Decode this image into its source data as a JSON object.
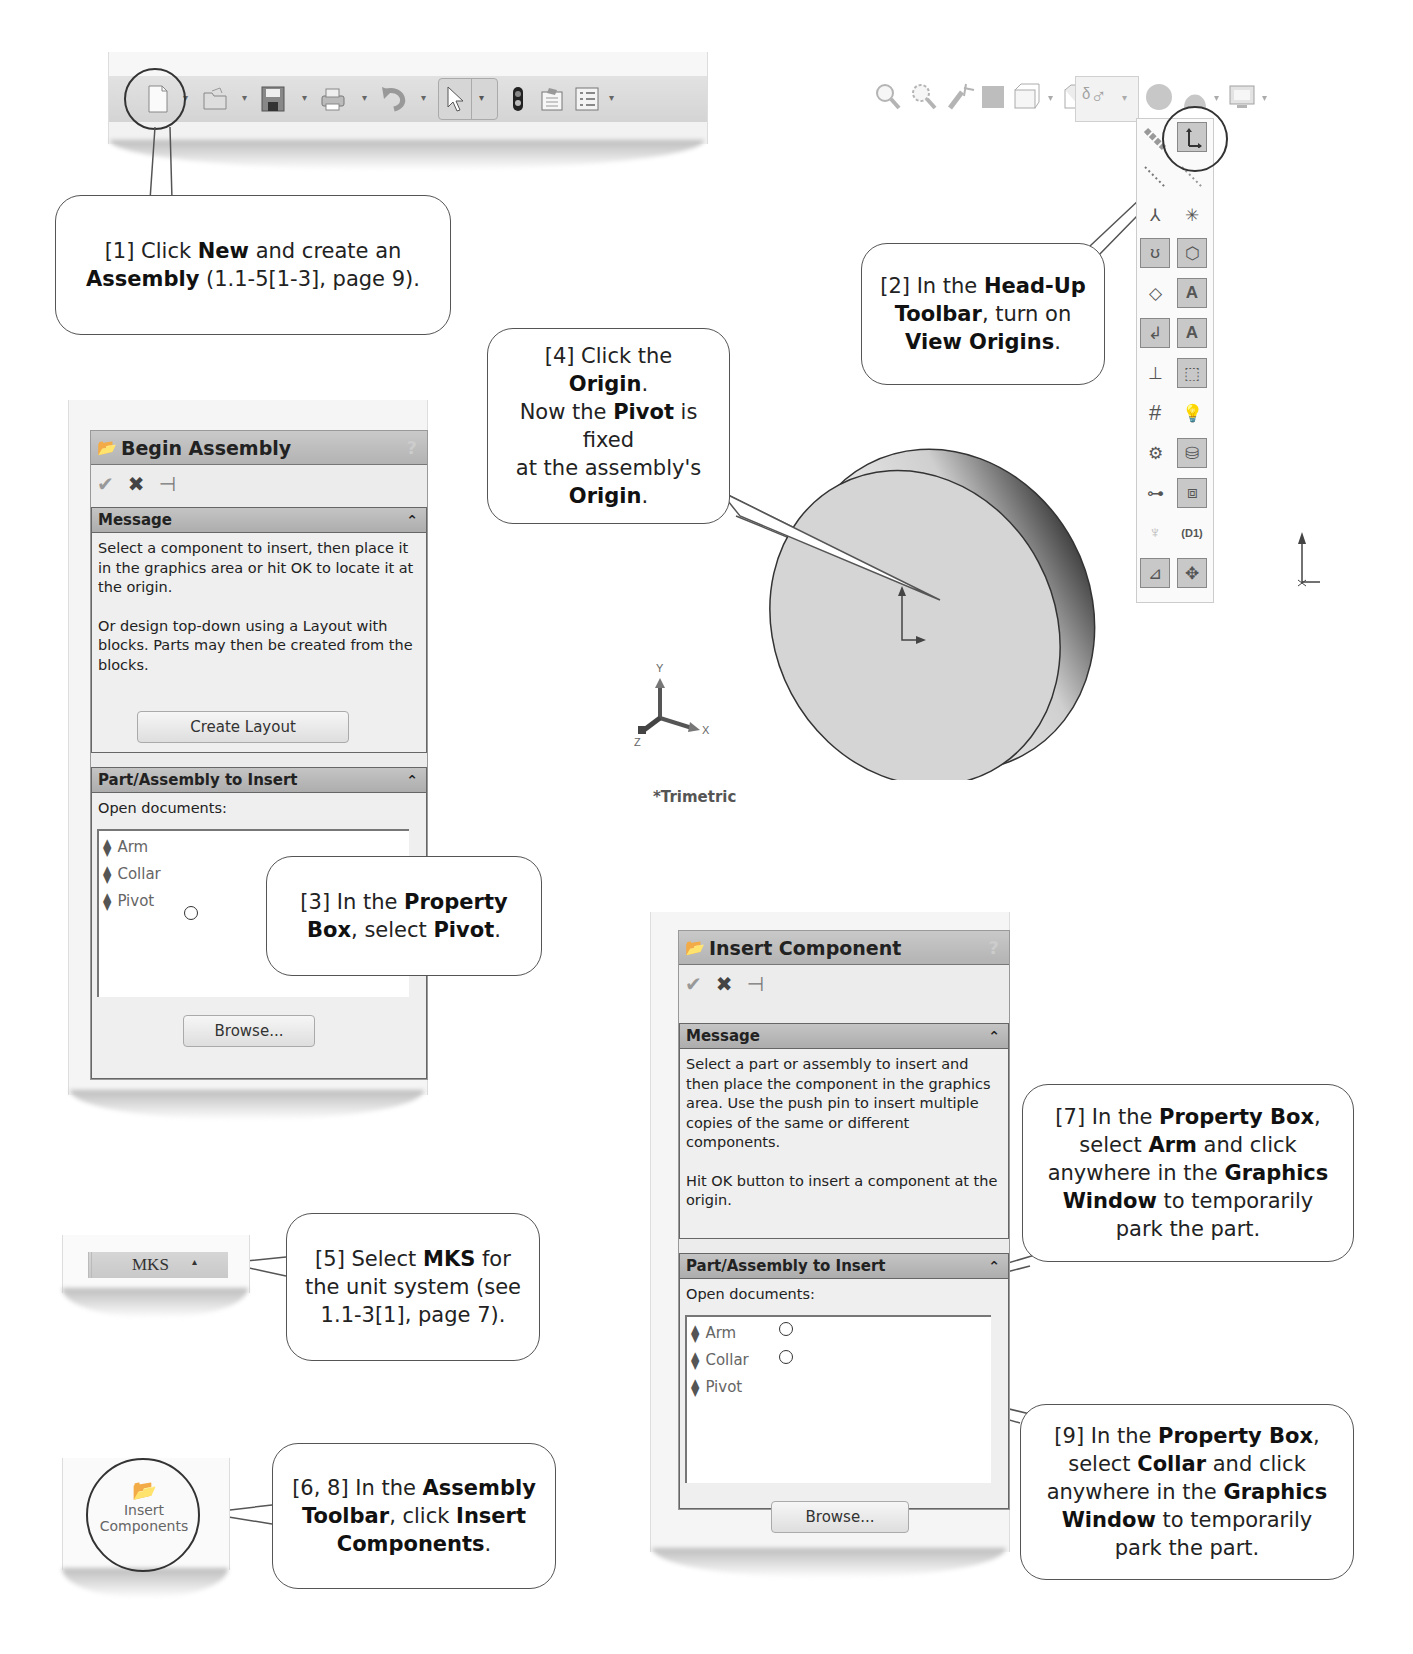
{
  "standard_toolbar": {
    "buttons": [
      {
        "name": "new",
        "icon": "new-document-icon",
        "glyph": "🗋"
      },
      {
        "name": "open",
        "icon": "open-folder-icon",
        "glyph": "📂"
      },
      {
        "name": "save",
        "icon": "save-disk-icon",
        "glyph": "💾"
      },
      {
        "name": "print",
        "icon": "printer-icon",
        "glyph": "🖶"
      },
      {
        "name": "undo",
        "icon": "undo-icon",
        "glyph": "↶"
      },
      {
        "name": "select",
        "icon": "select-arrow-icon",
        "glyph": "↖"
      },
      {
        "name": "rebuild",
        "icon": "rebuild-traffic-light-icon",
        "glyph": "▮"
      },
      {
        "name": "file-properties",
        "icon": "file-properties-icon",
        "glyph": "📋"
      },
      {
        "name": "options",
        "icon": "options-list-icon",
        "glyph": "☰"
      }
    ],
    "dropdown_glyph": "▾"
  },
  "headsup_toolbar": {
    "buttons": [
      {
        "name": "zoom-to-fit",
        "glyph": "🔍"
      },
      {
        "name": "zoom-to-area",
        "glyph": "🔎"
      },
      {
        "name": "previous-view",
        "glyph": "↶"
      },
      {
        "name": "section-view",
        "glyph": "▦"
      },
      {
        "name": "view-orientation",
        "glyph": "⧉"
      },
      {
        "name": "display-style",
        "glyph": "◻"
      },
      {
        "name": "hide-show-items",
        "glyph": "ᵟ♂"
      },
      {
        "name": "edit-appearance",
        "glyph": "●"
      },
      {
        "name": "apply-scene",
        "glyph": "▲"
      },
      {
        "name": "view-settings",
        "glyph": "🖥"
      }
    ],
    "flyout_items": [
      {
        "name": "view-axes",
        "glyph": "⟋",
        "on": false
      },
      {
        "name": "view-origins",
        "glyph": "⊾",
        "on": true
      },
      {
        "name": "view-temporary-axes",
        "glyph": "⋰",
        "on": false
      },
      {
        "name": "view-planes",
        "glyph": "⋱",
        "on": false
      },
      {
        "name": "view-coordinate-systems",
        "glyph": "⅄",
        "on": false
      },
      {
        "name": "view-points",
        "glyph": "✳",
        "on": false
      },
      {
        "name": "view-curves",
        "glyph": "ʊ",
        "on": true
      },
      {
        "name": "view-parting-lines",
        "glyph": "⬡",
        "on": true
      },
      {
        "name": "view-sketches",
        "glyph": "◇",
        "on": false
      },
      {
        "name": "view-annotations",
        "glyph": "A",
        "on": true
      },
      {
        "name": "view-3d-sketches",
        "glyph": "↲",
        "on": true
      },
      {
        "name": "view-all-annotations",
        "glyph": "A",
        "on": true
      },
      {
        "name": "view-sketch-relations",
        "glyph": "⊥",
        "on": false
      },
      {
        "name": "view-routing-points",
        "glyph": "⬚",
        "on": true
      },
      {
        "name": "view-grid",
        "glyph": "#",
        "on": false
      },
      {
        "name": "view-lights",
        "glyph": "💡",
        "on": false
      },
      {
        "name": "view-cameras",
        "glyph": "⚙",
        "on": false
      },
      {
        "name": "view-decals",
        "glyph": "⛁",
        "on": true
      },
      {
        "name": "view-weld-beads",
        "glyph": "⊶",
        "on": false
      },
      {
        "name": "view-dimxpert",
        "glyph": "⧈",
        "on": true
      },
      {
        "name": "view-center-of-mass",
        "glyph": "♆",
        "on": false
      },
      {
        "name": "view-dimension-names",
        "glyph": "(D1)",
        "on": false
      },
      {
        "name": "view-sketch-dimensions",
        "glyph": "⊿",
        "on": true
      },
      {
        "name": "view-grid-origin",
        "glyph": "✥",
        "on": true
      }
    ]
  },
  "begin_assembly": {
    "title": "Begin Assembly",
    "help": "?",
    "actions": {
      "ok": "✔",
      "cancel": "✖",
      "pin": "⊣"
    },
    "message_group": {
      "label": "Message",
      "collapse": "≈",
      "text1": "Select a component to insert, then place it in the graphics area or hit OK to locate it at the origin.",
      "text2": "Or design top-down using a Layout with blocks. Parts may then be created from the blocks.",
      "button": "Create Layout"
    },
    "insert_group": {
      "label": "Part/Assembly to Insert",
      "collapse": "≈",
      "open_docs_label": "Open documents:",
      "documents": [
        "Arm",
        "Collar",
        "Pivot"
      ],
      "browse": "Browse..."
    }
  },
  "insert_component": {
    "title": "Insert Component",
    "help": "?",
    "actions": {
      "ok": "✔",
      "cancel": "✖",
      "pin": "⊣"
    },
    "message_group": {
      "label": "Message",
      "collapse": "≈",
      "text1": "Select a part or assembly to insert and then place the component in the graphics area. Use the push pin to insert multiple copies of the same or different components.",
      "text2": "Hit OK button to insert a component at the origin."
    },
    "insert_group": {
      "label": "Part/Assembly to Insert",
      "collapse": "≈",
      "open_docs_label": "Open documents:",
      "documents": [
        "Arm",
        "Collar",
        "Pivot"
      ],
      "browse": "Browse..."
    }
  },
  "units": {
    "value": "MKS",
    "arrow": "▴"
  },
  "assembly_toolbar": {
    "insert_components_line1": "Insert",
    "insert_components_line2": "Components"
  },
  "viewport": {
    "triad": {
      "x": "X",
      "y": "Y",
      "z": "Z"
    },
    "view_name": "*Trimetric"
  },
  "callouts": {
    "c1": {
      "a": "[1] Click ",
      "b": "New",
      "c": " and create an ",
      "d": "Assembly",
      "e": " (1.1-5[1-3], page 9)."
    },
    "c2": {
      "a": "[2] In the ",
      "b": "Head-Up",
      "c": "Toolbar",
      "d": ", turn on",
      "e": "View Origins",
      "f": "."
    },
    "c3": {
      "a": "[3] In the ",
      "b": "Property",
      "c": "Box",
      "d": ", select ",
      "e": "Pivot",
      "f": "."
    },
    "c4": {
      "a": "[4] Click the ",
      "b": "Origin",
      "c": ".",
      "d": "Now the ",
      "e": "Pivot",
      "f": " is fixed",
      "g": "at the assembly's",
      "h": "Origin",
      "i": "."
    },
    "c5": {
      "a": "[5] Select ",
      "b": "MKS",
      "c": " for",
      "d": "the unit system (see",
      "e": "1.1-3[1], page 7)."
    },
    "c6": {
      "a": "[6, 8] In the ",
      "b": "Assembly",
      "c": "Toolbar",
      "d": ", click ",
      "e": "Insert",
      "f": "Components",
      "g": "."
    },
    "c7": {
      "a": "[7] In the ",
      "b": "Property Box",
      "c": ",",
      "d": "select ",
      "e": "Arm",
      "f": " and click",
      "g": "anywhere in the ",
      "h": "Graphics",
      "i": "Window",
      "j": " to temporarily",
      "k": "park the part."
    },
    "c9": {
      "a": "[9] In the ",
      "b": "Property Box",
      "c": ",",
      "d": "select ",
      "e": "Collar",
      "f": " and click",
      "g": "anywhere in the ",
      "h": "Graphics",
      "i": "Window",
      "j": " to temporarily",
      "k": "park the part."
    }
  }
}
